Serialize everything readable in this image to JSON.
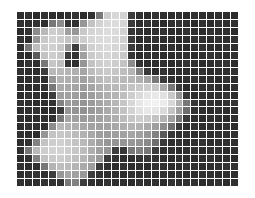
{
  "figure": {
    "title": "",
    "background_color": "#ffffff",
    "grid": {
      "visible": true,
      "line_color": "#ffffff",
      "line_width_px": 1,
      "columns": 28,
      "rows": 22,
      "origin_x_px": 17,
      "origin_y_px": 12,
      "width_px": 221,
      "height_px": 174
    },
    "colormap": {
      "type": "grayscale",
      "min_value": 0,
      "max_value": 255,
      "min_color": "#000000",
      "max_color": "#ffffff"
    }
  },
  "chart_data": {
    "type": "heatmap",
    "title": "",
    "subtitle": "",
    "xlabel": "",
    "ylabel": "",
    "legend": [],
    "annotations": [],
    "grid": true,
    "axis_ticks_visible": false,
    "ncols": 28,
    "nrows": 22,
    "value_range": [
      0,
      255
    ],
    "colormap": "gray",
    "values": [
      [
        45,
        48,
        42,
        50,
        46,
        44,
        48,
        52,
        46,
        50,
        120,
        205,
        215,
        210,
        60,
        48,
        44,
        50,
        46,
        44,
        48,
        42,
        50,
        46,
        44,
        48,
        46,
        44
      ],
      [
        48,
        44,
        50,
        46,
        120,
        140,
        52,
        48,
        150,
        195,
        210,
        218,
        220,
        214,
        58,
        44,
        50,
        46,
        44,
        48,
        50,
        46,
        44,
        48,
        44,
        50,
        46,
        48
      ],
      [
        44,
        50,
        140,
        185,
        205,
        200,
        160,
        150,
        200,
        212,
        216,
        220,
        218,
        210,
        56,
        50,
        44,
        48,
        50,
        46,
        44,
        50,
        48,
        44,
        50,
        46,
        48,
        44
      ],
      [
        50,
        46,
        150,
        200,
        210,
        205,
        195,
        190,
        205,
        214,
        218,
        220,
        216,
        208,
        60,
        44,
        48,
        50,
        46,
        48,
        44,
        46,
        50,
        48,
        44,
        50,
        46,
        50
      ],
      [
        46,
        120,
        190,
        205,
        208,
        200,
        150,
        60,
        175,
        208,
        214,
        218,
        214,
        205,
        58,
        48,
        44,
        46,
        48,
        50,
        46,
        44,
        48,
        50,
        46,
        44,
        50,
        46
      ],
      [
        48,
        44,
        90,
        195,
        205,
        198,
        60,
        50,
        160,
        202,
        210,
        214,
        210,
        200,
        55,
        44,
        50,
        48,
        44,
        46,
        50,
        48,
        44,
        46,
        50,
        48,
        44,
        48
      ],
      [
        44,
        50,
        46,
        120,
        198,
        190,
        52,
        46,
        150,
        195,
        205,
        210,
        205,
        195,
        140,
        50,
        44,
        46,
        48,
        44,
        46,
        50,
        48,
        44,
        46,
        48,
        50,
        44
      ],
      [
        50,
        46,
        44,
        60,
        185,
        185,
        180,
        175,
        165,
        188,
        198,
        202,
        198,
        190,
        180,
        130,
        58,
        44,
        50,
        46,
        48,
        44,
        46,
        50,
        44,
        48,
        46,
        50
      ],
      [
        46,
        48,
        50,
        46,
        150,
        178,
        175,
        170,
        160,
        172,
        185,
        192,
        190,
        185,
        182,
        175,
        165,
        120,
        58,
        50,
        44,
        48,
        50,
        46,
        48,
        44,
        50,
        46
      ],
      [
        48,
        44,
        46,
        50,
        120,
        170,
        168,
        165,
        155,
        165,
        175,
        182,
        185,
        188,
        195,
        200,
        205,
        200,
        170,
        120,
        58,
        44,
        46,
        48,
        50,
        46,
        44,
        48
      ],
      [
        44,
        50,
        48,
        44,
        60,
        160,
        162,
        158,
        150,
        158,
        168,
        175,
        180,
        190,
        205,
        218,
        228,
        232,
        225,
        200,
        150,
        58,
        44,
        50,
        46,
        48,
        50,
        44
      ],
      [
        50,
        46,
        44,
        48,
        50,
        130,
        155,
        152,
        148,
        155,
        165,
        172,
        182,
        198,
        215,
        230,
        240,
        242,
        235,
        215,
        175,
        120,
        55,
        46,
        50,
        44,
        48,
        50
      ],
      [
        46,
        48,
        50,
        44,
        46,
        60,
        150,
        148,
        145,
        152,
        160,
        170,
        180,
        195,
        210,
        225,
        232,
        230,
        218,
        195,
        160,
        110,
        50,
        48,
        44,
        50,
        46,
        46
      ],
      [
        48,
        44,
        46,
        50,
        48,
        120,
        165,
        160,
        155,
        158,
        162,
        168,
        175,
        188,
        198,
        205,
        202,
        195,
        180,
        160,
        120,
        58,
        46,
        44,
        50,
        48,
        44,
        48
      ],
      [
        44,
        50,
        48,
        46,
        140,
        185,
        180,
        175,
        168,
        162,
        160,
        162,
        168,
        175,
        180,
        178,
        170,
        158,
        140,
        110,
        58,
        44,
        50,
        46,
        48,
        44,
        50,
        44
      ],
      [
        50,
        46,
        44,
        150,
        195,
        200,
        195,
        188,
        178,
        168,
        158,
        155,
        158,
        162,
        165,
        160,
        150,
        130,
        90,
        55,
        48,
        50,
        44,
        48,
        46,
        50,
        46,
        50
      ],
      [
        46,
        48,
        130,
        195,
        205,
        208,
        202,
        195,
        185,
        172,
        160,
        150,
        148,
        150,
        152,
        148,
        138,
        110,
        58,
        46,
        50,
        44,
        48,
        50,
        44,
        46,
        48,
        46
      ],
      [
        48,
        120,
        185,
        205,
        210,
        210,
        205,
        198,
        188,
        175,
        160,
        148,
        60,
        55,
        120,
        130,
        120,
        60,
        48,
        50,
        44,
        48,
        50,
        46,
        48,
        50,
        44,
        48
      ],
      [
        44,
        50,
        130,
        195,
        202,
        205,
        200,
        192,
        182,
        168,
        155,
        60,
        50,
        46,
        48,
        52,
        58,
        50,
        46,
        44,
        50,
        46,
        44,
        48,
        50,
        44,
        46,
        44
      ],
      [
        50,
        46,
        48,
        120,
        180,
        190,
        188,
        180,
        170,
        158,
        60,
        48,
        44,
        50,
        46,
        48,
        44,
        50,
        48,
        44,
        46,
        50,
        48,
        44,
        46,
        48,
        50,
        50
      ],
      [
        46,
        48,
        50,
        46,
        60,
        150,
        165,
        160,
        152,
        60,
        50,
        46,
        48,
        44,
        50,
        46,
        48,
        44,
        50,
        46,
        48,
        44,
        46,
        50,
        48,
        44,
        48,
        46
      ],
      [
        48,
        44,
        46,
        50,
        48,
        50,
        120,
        130,
        60,
        48,
        44,
        50,
        46,
        48,
        44,
        50,
        46,
        48,
        44,
        50,
        46,
        48,
        50,
        44,
        46,
        50,
        44,
        48
      ]
    ]
  }
}
